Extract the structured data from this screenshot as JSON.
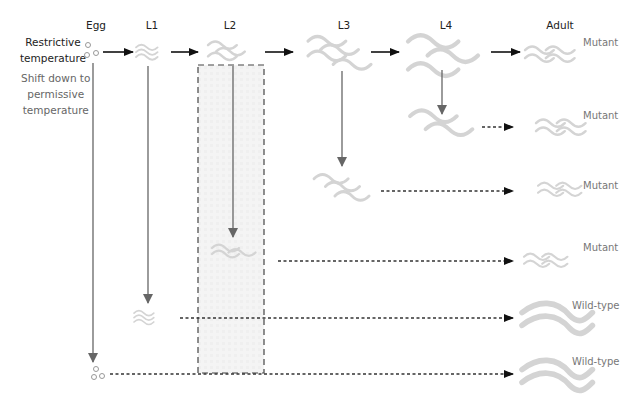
{
  "stages": [
    "Egg",
    "L1",
    "L2",
    "L3",
    "L4",
    "Adult"
  ],
  "conditions": {
    "restrictive": [
      "Restrictive",
      "temperature"
    ],
    "shift": [
      "Shift down to",
      "permissive",
      "temperature"
    ]
  },
  "outcomes": [
    {
      "shift_at": "Adult (no shift)",
      "result": "Mutant"
    },
    {
      "shift_at": "L4",
      "result": "Mutant"
    },
    {
      "shift_at": "L3",
      "result": "Mutant"
    },
    {
      "shift_at": "L2",
      "result": "Mutant"
    },
    {
      "shift_at": "L1",
      "result": "Wild-type"
    },
    {
      "shift_at": "Egg",
      "result": "Wild-type"
    }
  ],
  "highlight": {
    "region": "L2",
    "meaning": "temperature-sensitive period"
  },
  "colors": {
    "worm": "#d4d4d4",
    "arrow_solid": "#111111",
    "arrow_shift": "#666666",
    "dashed": "#333333",
    "highlight_fill": "#f2f2f2"
  }
}
